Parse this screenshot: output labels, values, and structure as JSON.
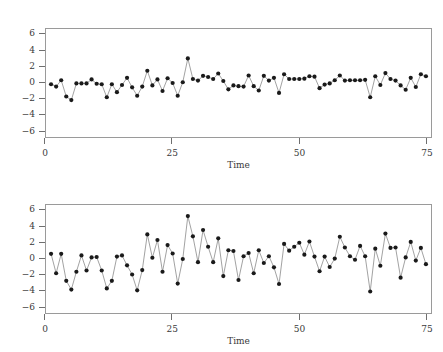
{
  "figure": {
    "background_color": "#ffffff",
    "frame_color": "#9a9a9a",
    "line_color": "#8a8a8a",
    "point_color": "#1a1a1a"
  },
  "chart_data": [
    {
      "type": "line",
      "panel": "top",
      "title": "",
      "xlabel": "Time",
      "ylabel": "",
      "xlim": [
        0,
        76
      ],
      "ylim": [
        -6.8,
        6.8
      ],
      "xticks": [
        0,
        25,
        50,
        75
      ],
      "yticks": [
        6,
        4,
        2,
        0,
        -2,
        -4,
        -6
      ],
      "xtick_labels": [
        "0",
        "25",
        "50",
        "75"
      ],
      "ytick_labels": [
        "6",
        "4",
        "2",
        "0",
        "−2",
        "−4",
        "−6"
      ],
      "grid": false,
      "legend": "none",
      "markers": "filled-circle",
      "x": [
        1,
        2,
        3,
        4,
        5,
        6,
        7,
        8,
        9,
        10,
        11,
        12,
        13,
        14,
        15,
        16,
        17,
        18,
        19,
        20,
        21,
        22,
        23,
        24,
        25,
        26,
        27,
        28,
        29,
        30,
        31,
        32,
        33,
        34,
        35,
        36,
        37,
        38,
        39,
        40,
        41,
        42,
        43,
        44,
        45,
        46,
        47,
        48,
        49,
        50,
        51,
        52,
        53,
        54,
        55,
        56,
        57,
        58,
        59,
        60,
        61,
        62,
        63,
        64,
        65,
        66,
        67,
        68,
        69,
        70,
        71,
        72,
        73,
        74,
        75
      ],
      "values": [
        -0.15,
        -0.45,
        0.35,
        -1.7,
        -2.15,
        -0.05,
        -0.05,
        -0.05,
        0.45,
        -0.1,
        -0.15,
        -1.8,
        -0.15,
        -1.15,
        -0.25,
        0.65,
        -0.55,
        -1.6,
        -0.45,
        1.55,
        -0.3,
        0.45,
        -1.0,
        0.6,
        0.0,
        -1.6,
        0.1,
        3.1,
        0.5,
        0.3,
        0.9,
        0.75,
        0.5,
        1.2,
        0.25,
        -0.8,
        -0.3,
        -0.4,
        -0.45,
        0.95,
        -0.4,
        -0.95,
        0.9,
        0.3,
        0.65,
        -1.25,
        1.1,
        0.5,
        0.5,
        0.5,
        0.55,
        0.85,
        0.8,
        -0.65,
        -0.2,
        -0.05,
        0.35,
        0.95,
        0.3,
        0.35,
        0.35,
        0.35,
        0.4,
        -1.8,
        0.85,
        -0.25,
        1.25,
        0.5,
        0.3,
        -0.3,
        -0.85,
        0.65,
        -0.5,
        1.1,
        0.85
      ]
    },
    {
      "type": "line",
      "panel": "bottom",
      "title": "",
      "xlabel": "Time",
      "ylabel": "",
      "xlim": [
        0,
        76
      ],
      "ylim": [
        -6.8,
        6.8
      ],
      "xticks": [
        0,
        25,
        50,
        75
      ],
      "yticks": [
        6,
        4,
        2,
        0,
        -2,
        -4,
        -6
      ],
      "xtick_labels": [
        "0",
        "25",
        "50",
        "75"
      ],
      "ytick_labels": [
        "6",
        "4",
        "2",
        "0",
        "−2",
        "−4",
        "−6"
      ],
      "grid": false,
      "legend": "none",
      "markers": "filled-circle",
      "x": [
        1,
        2,
        3,
        4,
        5,
        6,
        7,
        8,
        9,
        10,
        11,
        12,
        13,
        14,
        15,
        16,
        17,
        18,
        19,
        20,
        21,
        22,
        23,
        24,
        25,
        26,
        27,
        28,
        29,
        30,
        31,
        32,
        33,
        34,
        35,
        36,
        37,
        38,
        39,
        40,
        41,
        42,
        43,
        44,
        45,
        46,
        47,
        48,
        49,
        50,
        51,
        52,
        53,
        54,
        55,
        56,
        57,
        58,
        59,
        60,
        61,
        62,
        63,
        64,
        65,
        66,
        67,
        68,
        69,
        70,
        71,
        72,
        73,
        74,
        75
      ],
      "values": [
        0.65,
        -1.8,
        0.65,
        -2.75,
        -3.85,
        -1.6,
        0.45,
        -1.45,
        0.2,
        0.25,
        -1.45,
        -3.7,
        -2.75,
        0.3,
        0.45,
        -0.8,
        -1.95,
        -3.95,
        -1.4,
        3.1,
        0.15,
        2.4,
        -1.6,
        1.75,
        0.7,
        -3.1,
        0.0,
        5.4,
        2.85,
        -0.4,
        3.65,
        1.55,
        -0.4,
        2.6,
        -2.15,
        1.1,
        1.0,
        -2.65,
        0.35,
        0.75,
        -1.8,
        1.1,
        -0.5,
        0.35,
        -1.05,
        -3.15,
        1.9,
        1.05,
        1.55,
        2.05,
        0.55,
        2.2,
        0.3,
        -1.55,
        0.3,
        -1.0,
        0.05,
        2.8,
        1.45,
        0.35,
        -0.1,
        1.65,
        0.35,
        -4.1,
        1.3,
        -0.85,
        3.2,
        1.4,
        1.45,
        -2.35,
        0.2,
        2.15,
        -0.2,
        1.4,
        -0.65
      ]
    }
  ]
}
